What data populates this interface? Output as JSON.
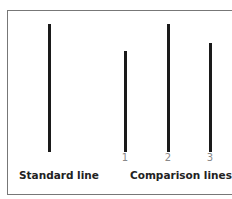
{
  "diagram": {
    "standard_label": "Standard line",
    "comparison_label": "Comparison lines",
    "comparison_numbers": [
      "1",
      "2",
      "3"
    ],
    "lines": [
      {
        "name": "standard",
        "x": 48,
        "top": 24,
        "bottom": 152
      },
      {
        "name": "1",
        "x": 124,
        "top": 51,
        "bottom": 152
      },
      {
        "name": "2",
        "x": 167,
        "top": 24,
        "bottom": 152
      },
      {
        "name": "3",
        "x": 209,
        "top": 43,
        "bottom": 152
      }
    ]
  }
}
